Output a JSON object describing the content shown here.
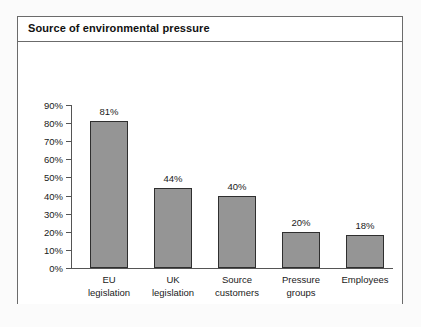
{
  "panel": {
    "title": "Source of environmental pressure"
  },
  "chart_data": {
    "type": "bar",
    "title": "Source of environmental pressure",
    "xlabel": "",
    "ylabel": "",
    "categories": [
      "EU legislation",
      "UK legislation",
      "Source customers",
      "Pressure groups",
      "Employees"
    ],
    "category_lines": [
      [
        "EU",
        "legislation"
      ],
      [
        "UK",
        "legislation"
      ],
      [
        "Source",
        "customers"
      ],
      [
        "Pressure",
        "groups"
      ],
      [
        "Employees",
        ""
      ]
    ],
    "values": [
      81,
      44,
      40,
      20,
      18
    ],
    "value_labels": [
      "81%",
      "44%",
      "40%",
      "20%",
      "18%"
    ],
    "ylim": [
      0,
      90
    ],
    "ytick_values": [
      0,
      10,
      20,
      30,
      40,
      50,
      60,
      70,
      80,
      90
    ],
    "ytick_labels": [
      "0%",
      "10%",
      "20%",
      "30%",
      "40%",
      "50%",
      "60%",
      "70%",
      "80%",
      "90%"
    ],
    "grid": false,
    "legend": false,
    "bar_color": "#959595",
    "bar_border_color": "#2f2f2f",
    "axis_color": "#555555",
    "background_color": "#ffffff"
  }
}
